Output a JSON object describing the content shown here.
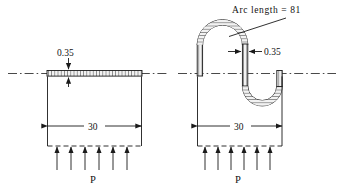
{
  "figure": {
    "background_color": "#ffffff",
    "line_color": "#1a1a1a",
    "strip_fill_color": "#e8e8e8",
    "centerline_style": "dash-dot",
    "panels": [
      {
        "id": "left-panel",
        "description": "flat-strip",
        "thickness_label": "0.35",
        "span_label": "30",
        "load_label": "P",
        "load_arrow_count": 6
      },
      {
        "id": "right-panel",
        "description": "buckled-serpentine-strip",
        "thickness_label": "0.35",
        "span_label": "30",
        "load_label": "P",
        "load_arrow_count": 6,
        "arc_length_label": "Arc length = 81"
      }
    ]
  },
  "labels": {
    "left_thickness": "0.35",
    "left_span": "30",
    "left_load": "P",
    "right_thickness": "0.35",
    "right_span": "30",
    "right_load": "P",
    "arc_length": "Arc length = 81"
  }
}
